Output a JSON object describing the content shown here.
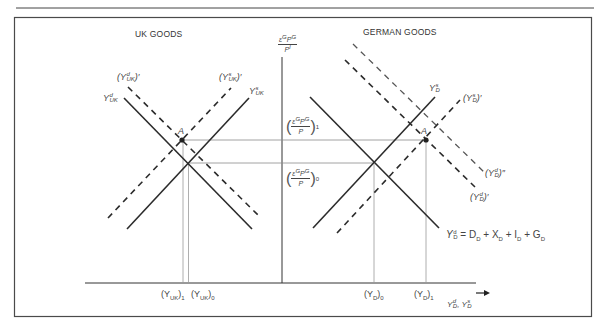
{
  "figure": {
    "panels": [
      {
        "id": "uk",
        "title": "UK GOODS"
      },
      {
        "id": "german",
        "title": "GERMAN GOODS"
      }
    ],
    "vertical_axis_label": {
      "num": "εᴵPᴵ",
      "num_text": "ε",
      "num_sup": "G",
      "num_p": "P",
      "num_p_sup": "G",
      "den": "P",
      "den_sup": "l"
    },
    "horizontal_axis_label": {
      "text": "Y",
      "sup1": "d",
      "sub1": "D",
      "sep": ", Y",
      "sup2": "s",
      "sub2": "D",
      "arrow": "→"
    },
    "price_levels": [
      {
        "id": "rer-1",
        "subscript": "1",
        "y": 140
      },
      {
        "id": "rer-0",
        "subscript": "0",
        "y": 163
      }
    ],
    "uk_curves": {
      "demand": {
        "label": "Y",
        "sup": "d",
        "sub": "UK",
        "style": "solid"
      },
      "supply": {
        "label": "Y",
        "sup": "s",
        "sub": "UK",
        "style": "solid"
      },
      "demand_shifted": {
        "label": "(Y",
        "sup": "d",
        "sub": "UK",
        "prime": ")′",
        "style": "dashed"
      },
      "supply_shifted": {
        "label": "(Y",
        "sup": "s",
        "sub": "UK",
        "prime": ")′",
        "style": "dashed"
      }
    },
    "german_curves": {
      "supply": {
        "label": "Y",
        "sup": "s",
        "sub": "D",
        "style": "solid"
      },
      "supply_shifted": {
        "label": "(Y",
        "sup": "s",
        "sub": "D",
        "prime": ")′",
        "style": "dashed"
      },
      "demand_shifted_2": {
        "label": "(Y",
        "sup": "d",
        "sub": "D",
        "prime": ")″",
        "style": "dashed"
      },
      "demand_shifted_1": {
        "label": "(Y",
        "sup": "d",
        "sub": "D",
        "prime": ")′",
        "style": "dashed"
      },
      "demand_equation": {
        "lhs": "Y",
        "sup": "d",
        "sub": "D",
        "rhs": " = D",
        "t1_sub": "D",
        "t2": " + X",
        "t2_sub": "D",
        "t3": " + I",
        "t3_sub": "D",
        "t4": " + G",
        "t4_sub": "D"
      }
    },
    "points": [
      {
        "id": "uk-A",
        "label": "A",
        "x": 182,
        "y": 140
      },
      {
        "id": "de-A",
        "label": "A",
        "x": 426,
        "y": 140
      }
    ],
    "x_ticks": {
      "uk": [
        {
          "label": "(Y",
          "sub": "UK",
          "close": ")",
          "idx": "1"
        },
        {
          "label": "(Y",
          "sub": "UK",
          "close": ")",
          "idx": "0"
        }
      ],
      "german": [
        {
          "label": "(Y",
          "sub": "D",
          "close": ")",
          "idx": "0"
        },
        {
          "label": "(Y",
          "sub": "D",
          "close": ")",
          "idx": "1"
        }
      ]
    },
    "colors": {
      "line": "#2b2b2b",
      "guide": "#8a8a8a",
      "frame": "#4a4a4a"
    }
  }
}
